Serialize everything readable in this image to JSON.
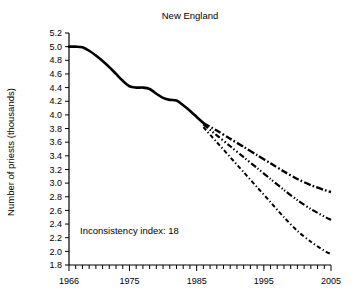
{
  "chart_data": {
    "type": "line",
    "title": "New England",
    "xlabel": "",
    "ylabel": "Number of priests (thousands)",
    "xlim": [
      1966,
      2005
    ],
    "ylim": [
      1.8,
      5.2
    ],
    "grid": false,
    "legend": "none",
    "x_tick_labels": [
      "1966",
      "1975",
      "1985",
      "1995",
      "2005"
    ],
    "x_tick_values": [
      1966,
      1975,
      1985,
      1995,
      2005
    ],
    "y_tick_labels": [
      "5.2",
      "5.0",
      "4.8",
      "4.6",
      "4.4",
      "4.2",
      "4.0",
      "3.8",
      "3.6",
      "3.4",
      "3.2",
      "3.0",
      "2.8",
      "2.6",
      "2.4",
      "2.2",
      "2.0",
      "1.8"
    ],
    "y_tick_values": [
      5.2,
      5.0,
      4.8,
      4.6,
      4.4,
      4.2,
      4.0,
      3.8,
      3.6,
      3.4,
      3.2,
      3.0,
      2.8,
      2.6,
      2.4,
      2.2,
      2.0,
      1.8
    ],
    "annotations": [
      {
        "name": "inconsistency-index",
        "text": "Inconsistency index: 18",
        "x": 1975,
        "y": 2.25
      }
    ],
    "series": [
      {
        "name": "historical",
        "style": "solid",
        "x": [
          1966,
          1967,
          1968,
          1969,
          1970,
          1971,
          1972,
          1973,
          1974,
          1975,
          1976,
          1977,
          1978,
          1979,
          1980,
          1981,
          1982,
          1983,
          1984,
          1985,
          1986
        ],
        "values": [
          5.0,
          5.0,
          4.99,
          4.94,
          4.87,
          4.79,
          4.7,
          4.6,
          4.5,
          4.42,
          4.4,
          4.4,
          4.38,
          4.31,
          4.25,
          4.22,
          4.21,
          4.14,
          4.06,
          3.97,
          3.88
        ]
      },
      {
        "name": "projection-high",
        "style": "dash-dot",
        "x": [
          1986,
          1988,
          1990,
          1992,
          1994,
          1996,
          1998,
          2000,
          2002,
          2004,
          2005
        ],
        "values": [
          3.88,
          3.77,
          3.65,
          3.53,
          3.41,
          3.29,
          3.17,
          3.06,
          2.97,
          2.9,
          2.87
        ]
      },
      {
        "name": "projection-mid",
        "style": "dash-dot-dot",
        "x": [
          1986,
          1988,
          1990,
          1992,
          1994,
          1996,
          1998,
          2000,
          2002,
          2004,
          2005
        ],
        "values": [
          3.86,
          3.7,
          3.54,
          3.38,
          3.22,
          3.06,
          2.9,
          2.75,
          2.62,
          2.51,
          2.46
        ]
      },
      {
        "name": "projection-low",
        "style": "fine-dash-dot",
        "x": [
          1986,
          1988,
          1990,
          1992,
          1994,
          1996,
          1998,
          2000,
          2002,
          2004,
          2005
        ],
        "values": [
          3.82,
          3.6,
          3.38,
          3.16,
          2.94,
          2.72,
          2.5,
          2.3,
          2.14,
          2.01,
          1.96
        ]
      }
    ]
  }
}
